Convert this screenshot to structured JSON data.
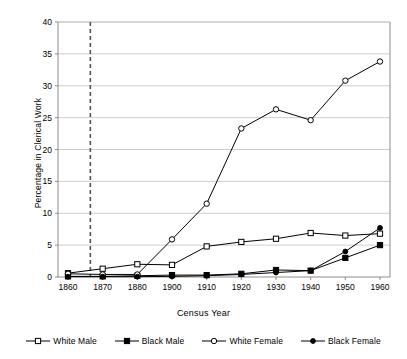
{
  "chart_data": {
    "type": "line",
    "title": "",
    "xlabel": "Census Year",
    "ylabel": "Percentage in Clerical Work",
    "categories": [
      "1860",
      "1870",
      "1880",
      "1900",
      "1910",
      "1920",
      "1930",
      "1940",
      "1950",
      "1960"
    ],
    "ylim": [
      0,
      40
    ],
    "yticks": [
      0,
      5,
      10,
      15,
      20,
      25,
      30,
      35,
      40
    ],
    "grid": "horizontal",
    "legend_position": "bottom",
    "annotations": [
      {
        "name": "emancipation-marker",
        "type": "vertical-dashed-line",
        "x_value": "1865",
        "style": "dashed",
        "color": "#555555"
      }
    ],
    "series": [
      {
        "name": "White Male",
        "marker": "open-square",
        "color": "#000000",
        "values": [
          0.6,
          1.3,
          2.0,
          1.9,
          4.8,
          5.5,
          6.0,
          6.9,
          6.5,
          6.8
        ]
      },
      {
        "name": "Black Male",
        "marker": "filled-square",
        "color": "#000000",
        "values": [
          0.1,
          0.1,
          0.2,
          0.3,
          0.3,
          0.5,
          1.1,
          1.0,
          3.0,
          5.0
        ]
      },
      {
        "name": "White Female",
        "marker": "open-circle",
        "color": "#000000",
        "values": [
          0.5,
          0.4,
          0.4,
          5.9,
          11.5,
          23.3,
          26.3,
          24.6,
          30.8,
          33.8
        ]
      },
      {
        "name": "Black Female",
        "marker": "filled-circle",
        "color": "#000000",
        "values": [
          0.05,
          0.05,
          0.05,
          0.1,
          0.2,
          0.4,
          0.7,
          1.0,
          4.0,
          7.7
        ]
      }
    ]
  },
  "legend": {
    "items": [
      {
        "label": "White Male",
        "marker": "open-square"
      },
      {
        "label": "Black Male",
        "marker": "filled-square"
      },
      {
        "label": "White Female",
        "marker": "open-circle"
      },
      {
        "label": "Black Female",
        "marker": "filled-circle"
      }
    ]
  },
  "axes": {
    "y_title": "Percentage in Clerical Work",
    "x_title": "Census Year",
    "y_tick_labels": [
      "0",
      "5",
      "10",
      "15",
      "20",
      "25",
      "30",
      "35",
      "40"
    ],
    "x_tick_labels": [
      "1860",
      "1870",
      "1880",
      "1900",
      "1910",
      "1920",
      "1930",
      "1940",
      "1950",
      "1960"
    ]
  },
  "colors": {
    "ink": "#000000",
    "gridline": "#b8b8b8",
    "axis": "#808080",
    "dashed_marker": "#555555",
    "background": "#ffffff"
  }
}
